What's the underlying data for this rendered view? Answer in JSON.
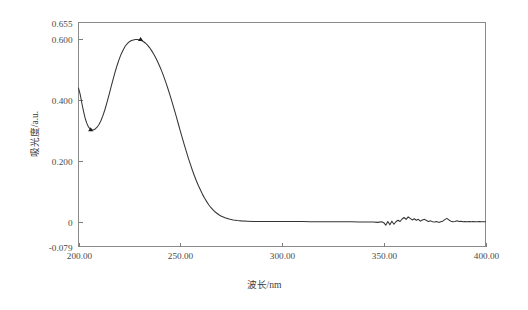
{
  "chart_data": {
    "type": "line",
    "title": "",
    "subtitle": "",
    "xlabel": "波长/nm",
    "ylabel": "吸光度/a.u.",
    "xlim": [
      200.0,
      400.0
    ],
    "ylim": [
      -0.079,
      0.655
    ],
    "grid": false,
    "legend": null,
    "legend_position": "none",
    "xticks": [
      200.0,
      250.0,
      300.0,
      350.0,
      400.0
    ],
    "xtick_labels": [
      "200.00",
      "250.00",
      "300.00",
      "350.00",
      "400.00"
    ],
    "yticks": [
      -0.079,
      0,
      0.2,
      0.4,
      0.6,
      0.655
    ],
    "ytick_labels": [
      "-0.079",
      "0",
      "0.200",
      "0.400",
      "0.600",
      "0.655"
    ],
    "line_color": "#343434",
    "marker_color": "#1c1c1c",
    "annotations": [
      {
        "label": "local minimum marker",
        "x": 206.0,
        "y": 0.303
      },
      {
        "label": "absorption peak marker",
        "x": 230.5,
        "y": 0.599
      }
    ],
    "series": [
      {
        "name": "吸收光谱",
        "x": [
          200.0,
          200.8,
          201.6,
          202.4,
          203.2,
          204.0,
          204.8,
          205.6,
          206.4,
          207.2,
          208.0,
          209.0,
          210.0,
          211.0,
          212.0,
          213.0,
          214.0,
          215.0,
          216.0,
          217.0,
          218.0,
          219.0,
          220.0,
          221.0,
          222.0,
          223.0,
          224.0,
          225.0,
          226.0,
          227.0,
          228.0,
          229.0,
          230.0,
          231.0,
          232.0,
          233.0,
          234.0,
          235.0,
          236.0,
          237.0,
          238.0,
          239.0,
          240.0,
          241.0,
          242.0,
          243.0,
          244.0,
          245.0,
          246.0,
          247.0,
          248.0,
          249.0,
          250.0,
          251.0,
          252.0,
          253.0,
          254.0,
          255.0,
          256.0,
          257.0,
          258.0,
          259.0,
          260.0,
          261.0,
          262.0,
          263.0,
          264.0,
          265.0,
          266.0,
          267.0,
          268.0,
          269.0,
          270.0,
          272.0,
          274.0,
          276.0,
          278.0,
          280.0,
          283.0,
          286.0,
          290.0,
          294.0,
          298.0,
          302.0,
          306.0,
          310.0,
          314.0,
          318.0,
          322.0,
          326.0,
          330.0,
          334.0,
          338.0,
          342.0,
          345.0,
          347.0,
          349.0,
          350.0,
          351.0,
          352.0,
          353.0,
          354.0,
          355.0,
          356.0,
          357.0,
          358.0,
          359.0,
          360.0,
          361.0,
          362.0,
          363.0,
          364.0,
          365.0,
          366.0,
          367.0,
          368.0,
          369.0,
          370.0,
          371.0,
          372.0,
          373.0,
          374.0,
          375.0,
          376.0,
          377.0,
          378.0,
          379.0,
          380.0,
          381.0,
          382.0,
          383.0,
          384.0,
          385.0,
          386.0,
          387.0,
          388.0,
          389.0,
          390.0,
          391.0,
          392.0,
          393.0,
          394.0,
          395.0,
          396.0,
          397.0,
          398.0,
          399.0,
          400.0
        ],
        "y": [
          0.44,
          0.42,
          0.392,
          0.366,
          0.343,
          0.326,
          0.314,
          0.307,
          0.303,
          0.303,
          0.305,
          0.311,
          0.32,
          0.333,
          0.35,
          0.37,
          0.393,
          0.418,
          0.444,
          0.469,
          0.493,
          0.515,
          0.535,
          0.552,
          0.566,
          0.578,
          0.586,
          0.592,
          0.596,
          0.598,
          0.599,
          0.599,
          0.598,
          0.596,
          0.592,
          0.587,
          0.58,
          0.572,
          0.562,
          0.551,
          0.539,
          0.525,
          0.51,
          0.494,
          0.476,
          0.457,
          0.437,
          0.416,
          0.394,
          0.371,
          0.348,
          0.324,
          0.3,
          0.277,
          0.254,
          0.232,
          0.21,
          0.19,
          0.17,
          0.152,
          0.135,
          0.119,
          0.105,
          0.091,
          0.079,
          0.068,
          0.058,
          0.049,
          0.042,
          0.035,
          0.03,
          0.025,
          0.021,
          0.015,
          0.011,
          0.008,
          0.006,
          0.005,
          0.004,
          0.003,
          0.003,
          0.003,
          0.003,
          0.003,
          0.003,
          0.003,
          0.002,
          0.002,
          0.002,
          0.002,
          0.002,
          0.002,
          0.001,
          0.001,
          0.001,
          0.0,
          0.002,
          -0.001,
          -0.009,
          0.003,
          -0.008,
          0.004,
          -0.006,
          0.002,
          0.007,
          0.003,
          0.011,
          0.016,
          0.01,
          0.018,
          0.013,
          0.008,
          0.012,
          0.007,
          0.01,
          0.004,
          0.008,
          0.01,
          0.006,
          0.003,
          0.005,
          0.002,
          0.001,
          0.003,
          0.0,
          0.002,
          0.004,
          0.009,
          0.013,
          0.008,
          0.004,
          0.002,
          0.003,
          0.005,
          0.003,
          0.004,
          0.002,
          0.003,
          0.002,
          0.003,
          0.002,
          0.003,
          0.002,
          0.002,
          0.003,
          0.002,
          0.002,
          0.002
        ]
      }
    ]
  }
}
